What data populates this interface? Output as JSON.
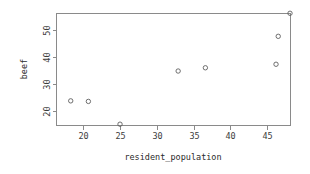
{
  "chart_data": {
    "type": "scatter",
    "title": "",
    "xlabel": "resident_population",
    "ylabel": "beef",
    "xlim": [
      16.3,
      48.1
    ],
    "ylim": [
      14.9,
      56.2
    ],
    "grid": false,
    "legend": false,
    "xticks": [
      20,
      25,
      30,
      35,
      40,
      45
    ],
    "xtick_labels": [
      "20",
      "25",
      "30",
      "35",
      "40",
      "45"
    ],
    "yticks": [
      20,
      30,
      40,
      50
    ],
    "ytick_labels": [
      "20",
      "30",
      "40",
      "50"
    ],
    "marker": "open-circle",
    "marker_color": "#5f5f5f",
    "points": [
      {
        "x": 18.3,
        "y": 23.8
      },
      {
        "x": 20.7,
        "y": 23.6
      },
      {
        "x": 25.0,
        "y": 15.2
      },
      {
        "x": 32.9,
        "y": 34.8
      },
      {
        "x": 36.6,
        "y": 36.0
      },
      {
        "x": 46.2,
        "y": 37.3
      },
      {
        "x": 46.5,
        "y": 47.6
      },
      {
        "x": 48.1,
        "y": 56.1
      }
    ],
    "x": [
      18.3,
      20.7,
      25.0,
      32.9,
      36.6,
      46.2,
      46.5,
      48.1
    ],
    "values": [
      23.8,
      23.6,
      15.2,
      34.8,
      36.0,
      37.3,
      47.6,
      56.1
    ]
  },
  "plot_box": {
    "left": 56,
    "right": 290,
    "top": 13,
    "bottom": 125
  }
}
